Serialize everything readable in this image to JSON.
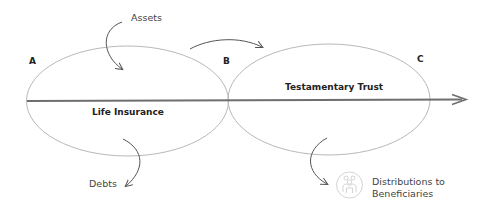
{
  "diagram": {
    "points": [
      {
        "id": "A",
        "label": "A"
      },
      {
        "id": "B",
        "label": "B"
      },
      {
        "id": "C",
        "label": "C"
      }
    ],
    "phases": [
      {
        "name": "life-insurance",
        "label": "Life Insurance"
      },
      {
        "name": "testamentary-trust",
        "label": "Testamentary Trust"
      }
    ],
    "flows": {
      "in": "Assets",
      "out": "Debts",
      "distribution_line1": "Distributions to",
      "distribution_line2": "Beneficiaries"
    },
    "icons": {
      "beneficiaries": "people-group-icon"
    },
    "colors": {
      "ellipse_stroke": "#b5b5b5",
      "axis": "#6e6e6e",
      "arrow": "#555555",
      "text": "#333333"
    }
  }
}
